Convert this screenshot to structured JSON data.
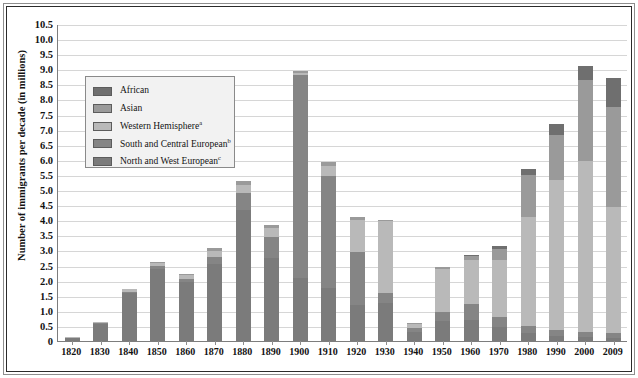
{
  "chart_data": {
    "type": "bar",
    "subtype": "stacked",
    "title": "",
    "xlabel": "",
    "ylabel": "Number of immigrants per decade (in millions)",
    "ylim": [
      0,
      10.5
    ],
    "ytick_step": 0.5,
    "grid": true,
    "legend_position": "upper-left-inset",
    "ytick_labels": [
      "10.5",
      "10.0",
      "9.5",
      "9.0",
      "8.5",
      "8.0",
      "7.5",
      "7.0",
      "6.5",
      "6.0",
      "5.5",
      "5.0",
      "4.5",
      "4.0",
      "3.5",
      "3.0",
      "2.5",
      "2.0",
      "1.5",
      "1.0",
      "0.5",
      "0"
    ],
    "categories": [
      "1820",
      "1830",
      "1840",
      "1850",
      "1860",
      "1870",
      "1880",
      "1890",
      "1900",
      "1910",
      "1920",
      "1930",
      "1940",
      "1950",
      "1960",
      "1970",
      "1980",
      "1990",
      "2000",
      "2009"
    ],
    "series": [
      {
        "name": "North and West European",
        "key": "north_west_european",
        "color": "#7b7b7b",
        "values": [
          0.12,
          0.58,
          1.6,
          2.4,
          1.95,
          2.55,
          4.35,
          2.75,
          2.1,
          1.75,
          1.2,
          1.25,
          0.3,
          0.65,
          0.7,
          0.45,
          0.25,
          0.18,
          0.12,
          0.1
        ]
      },
      {
        "name": "South and Central European",
        "key": "south_central_european",
        "color": "#858585",
        "values": [
          0.0,
          0.02,
          0.04,
          0.07,
          0.11,
          0.22,
          0.55,
          0.7,
          6.7,
          3.7,
          1.75,
          0.33,
          0.12,
          0.3,
          0.52,
          0.35,
          0.25,
          0.2,
          0.18,
          0.15
        ]
      },
      {
        "name": "Western Hemisphere",
        "key": "western_hemisphere",
        "color": "#b9b9b9",
        "values": [
          0.02,
          0.04,
          0.07,
          0.1,
          0.12,
          0.2,
          0.26,
          0.3,
          0.08,
          0.35,
          1.05,
          2.4,
          0.16,
          1.45,
          1.45,
          1.9,
          3.6,
          4.95,
          5.65,
          4.2
        ]
      },
      {
        "name": "Asian",
        "key": "asian",
        "color": "#9a9a9a",
        "values": [
          0.0,
          0.0,
          0.0,
          0.05,
          0.05,
          0.12,
          0.15,
          0.08,
          0.05,
          0.12,
          0.12,
          0.03,
          0.02,
          0.05,
          0.15,
          0.36,
          1.4,
          1.5,
          2.7,
          3.3
        ]
      },
      {
        "name": "African",
        "key": "african",
        "color": "#6f6f6f",
        "values": [
          0.0,
          0.0,
          0.0,
          0.0,
          0.0,
          0.0,
          0.0,
          0.0,
          0.0,
          0.0,
          0.0,
          0.0,
          0.0,
          0.0,
          0.02,
          0.08,
          0.2,
          0.35,
          0.45,
          0.95
        ]
      }
    ],
    "totals": [
      0.14,
      0.64,
      1.71,
      2.62,
      2.23,
      3.09,
      5.31,
      3.83,
      8.93,
      5.92,
      4.12,
      0.53,
      0.6,
      1.04,
      2.55,
      3.14,
      4.25,
      7.18,
      9.1,
      10.2
    ],
    "legend": [
      {
        "label": "African",
        "footnote": "",
        "color": "#6f6f6f"
      },
      {
        "label": "Asian",
        "footnote": "",
        "color": "#9a9a9a"
      },
      {
        "label": "Western Hemisphere",
        "footnote": "a",
        "color": "#b9b9b9"
      },
      {
        "label": "South and Central European",
        "footnote": "b",
        "color": "#858585"
      },
      {
        "label": "North and West European",
        "footnote": "c",
        "color": "#7b7b7b"
      }
    ]
  }
}
